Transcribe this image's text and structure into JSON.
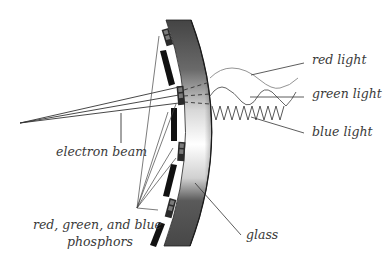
{
  "diagram": {
    "colors": {
      "glass_dark": "#4a4a4a",
      "glass_light": "#ffffff",
      "phosphor_dark": "#2a2a2a",
      "phosphor_mid": "#7a7a7a",
      "mask": "#111111",
      "line": "#333333",
      "wave": "#555555",
      "label": "#3a3a3a"
    },
    "labels": {
      "red_light": "red light",
      "green_light": "green light",
      "blue_light": "blue light",
      "electron_beam": "electron beam",
      "phosphors_line1": "red, green, and blue",
      "phosphors_line2": "phosphors",
      "glass": "glass"
    },
    "components": [
      "glass",
      "phosphor-triads",
      "shadow-mask-bars",
      "electron-beam",
      "red-light-wave",
      "green-light-wave",
      "blue-light-wave"
    ]
  }
}
